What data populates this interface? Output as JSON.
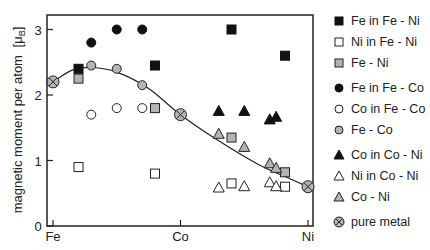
{
  "chart_data": {
    "type": "scatter",
    "title": "",
    "xlabel": "",
    "ylabel": "magnetic moment per atom [μB]",
    "ylim": [
      0,
      3.2
    ],
    "yticks": [
      0,
      1,
      2,
      3
    ],
    "xticks": [
      "Fe",
      "Co",
      "Ni"
    ],
    "x_note": "composition axis: Fe = 0, Co = 1, Ni = 2 (alloy composition between pure metals)",
    "curve": {
      "name": "Slater-Pauling curve",
      "x": [
        0,
        0.15,
        0.3,
        0.5,
        0.75,
        1.0,
        1.3,
        1.6,
        1.8,
        2.0
      ],
      "y": [
        2.2,
        2.38,
        2.42,
        2.35,
        2.1,
        1.7,
        1.3,
        0.95,
        0.77,
        0.6
      ]
    },
    "series": [
      {
        "name": "Fe in Fe - Ni",
        "marker": "square",
        "fill": "black",
        "x": [
          0.2,
          0.8,
          1.4,
          1.82
        ],
        "y": [
          2.4,
          2.45,
          3.0,
          2.6
        ]
      },
      {
        "name": "Ni in Fe - Ni",
        "marker": "square",
        "fill": "white",
        "x": [
          0.2,
          0.8,
          1.4,
          1.82
        ],
        "y": [
          0.9,
          0.8,
          0.65,
          0.6
        ]
      },
      {
        "name": "Fe - Ni",
        "marker": "square",
        "fill": "gray",
        "x": [
          0.2,
          0.8,
          1.4,
          1.82
        ],
        "y": [
          2.25,
          1.8,
          1.35,
          0.82
        ]
      },
      {
        "name": "Fe in Fe - Co",
        "marker": "circle",
        "fill": "black",
        "x": [
          0.3,
          0.5,
          0.7
        ],
        "y": [
          2.8,
          3.0,
          3.0
        ]
      },
      {
        "name": "Co in Fe - Co",
        "marker": "circle",
        "fill": "white",
        "x": [
          0.3,
          0.5,
          0.7
        ],
        "y": [
          1.7,
          1.8,
          1.8
        ]
      },
      {
        "name": "Fe - Co",
        "marker": "circle",
        "fill": "gray",
        "x": [
          0.3,
          0.5,
          0.7
        ],
        "y": [
          2.45,
          2.4,
          2.15
        ]
      },
      {
        "name": "Co in Co - Ni",
        "marker": "triangle",
        "fill": "black",
        "x": [
          1.3,
          1.5,
          1.7,
          1.75
        ],
        "y": [
          1.75,
          1.75,
          1.62,
          1.66
        ]
      },
      {
        "name": "Ni in Co - Ni",
        "marker": "triangle",
        "fill": "white",
        "x": [
          1.3,
          1.5,
          1.7,
          1.75
        ],
        "y": [
          0.58,
          0.6,
          0.66,
          0.6
        ]
      },
      {
        "name": "Co - Ni",
        "marker": "triangle",
        "fill": "gray",
        "x": [
          1.3,
          1.5,
          1.7,
          1.75
        ],
        "y": [
          1.4,
          1.2,
          0.95,
          0.88
        ]
      },
      {
        "name": "pure metal",
        "marker": "otimes",
        "fill": "gray",
        "x": [
          0,
          1,
          2
        ],
        "y": [
          2.2,
          1.7,
          0.6
        ]
      }
    ],
    "legend_position": "right",
    "grid": false
  },
  "axis": {
    "y_label_main": "magnetic moment per atom",
    "y_label_unit_mu": "[μ",
    "y_label_unit_sub": "B",
    "y_label_unit_close": "]",
    "y_tick_labels": [
      "0",
      "1",
      "2",
      "3"
    ],
    "x_tick_labels": [
      "Fe",
      "Co",
      "Ni"
    ]
  },
  "legend": {
    "items": [
      {
        "label": "Fe in Fe - Ni"
      },
      {
        "label": "Ni in Fe - Ni"
      },
      {
        "label": "Fe - Ni"
      },
      {
        "label": "Fe in Fe - Co"
      },
      {
        "label": "Co in Fe - Co"
      },
      {
        "label": "Fe - Co"
      },
      {
        "label": "Co in Co - Ni"
      },
      {
        "label": "Ni in Co - Ni"
      },
      {
        "label": "Co - Ni"
      },
      {
        "label": "pure metal"
      }
    ]
  },
  "colors": {
    "black": "#111111",
    "gray": "#b4b4b4",
    "white": "#ffffff",
    "stroke": "#222222"
  }
}
